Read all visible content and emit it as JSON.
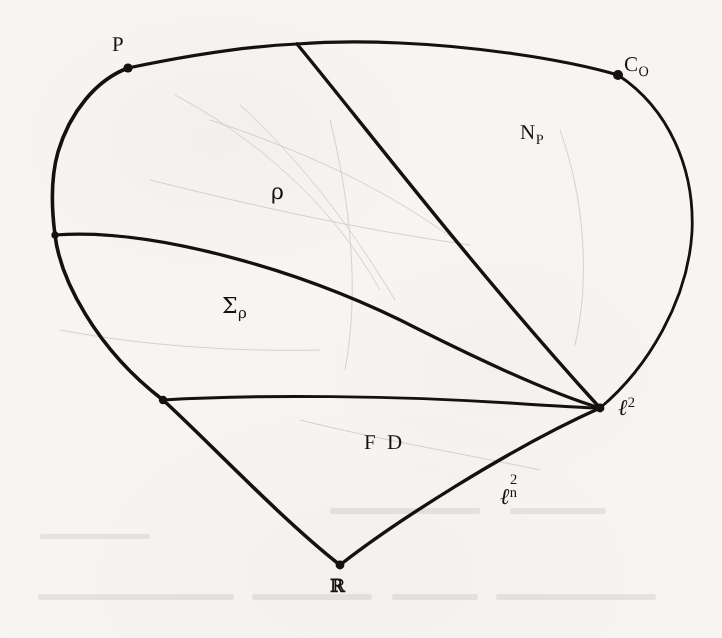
{
  "figure": {
    "kind": "hand-drawn-mathematical-diagram",
    "background_color": "#f6f5f3",
    "ink_color": "#14120f",
    "width": 722,
    "height": 638,
    "labels": {
      "P": "P",
      "C_O_base": "C",
      "C_O_sub": "O",
      "N_P_base": "N",
      "N_P_sub": "P",
      "rho": "ρ",
      "Sigma_base": "Σ",
      "Sigma_sub": "ρ",
      "FD": "F D",
      "l2_base": "ℓ",
      "l2_sup": "2",
      "l2n_base": "ℓ",
      "l2n_sup": "2",
      "l2n_sub": "n",
      "R": "ℝ"
    },
    "vertices": [
      {
        "name": "P",
        "x": 128,
        "y": 68
      },
      {
        "name": "C_O",
        "x": 618,
        "y": 75
      },
      {
        "name": "top-junction",
        "x": 297,
        "y": 44
      },
      {
        "name": "left-upper-node",
        "x": 55,
        "y": 235
      },
      {
        "name": "left-lower-node",
        "x": 163,
        "y": 400
      },
      {
        "name": "l2",
        "x": 600,
        "y": 408
      },
      {
        "name": "R",
        "x": 340,
        "y": 565
      }
    ],
    "regions": [
      "N_P",
      "ρ",
      "Σ_ρ",
      "F D"
    ]
  },
  "ghost_text": {
    "line": "pres ... oit ...  trii ...  i.i  il ...  vi ... ovg e.2.2 mi  1o1o.1 ol"
  }
}
